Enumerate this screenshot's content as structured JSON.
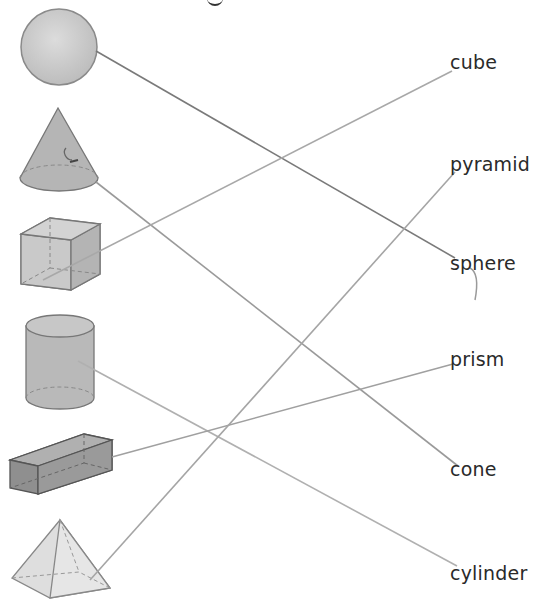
{
  "title_fragment": "g",
  "shapes": [
    {
      "id": "sphere",
      "name": "sphere"
    },
    {
      "id": "cone",
      "name": "cone"
    },
    {
      "id": "cube",
      "name": "cube"
    },
    {
      "id": "cylinder",
      "name": "cylinder"
    },
    {
      "id": "rect-prism",
      "name": "rectangular prism"
    },
    {
      "id": "pyramid",
      "name": "square pyramid"
    }
  ],
  "labels": [
    {
      "text": "cube",
      "x": 450,
      "y": 53
    },
    {
      "text": "pyramid",
      "x": 450,
      "y": 155
    },
    {
      "text": "sphere",
      "x": 450,
      "y": 254
    },
    {
      "text": "prism",
      "x": 450,
      "y": 350
    },
    {
      "text": "cone",
      "x": 450,
      "y": 460
    },
    {
      "text": "cylinder",
      "x": 450,
      "y": 564
    }
  ],
  "connections": [
    {
      "from": "sphere",
      "to": "sphere",
      "x1": 96,
      "y1": 51,
      "x2": 455,
      "y2": 258,
      "color": "#7a7a7a"
    },
    {
      "from": "cone",
      "to": "cone",
      "x1": 96,
      "y1": 182,
      "x2": 458,
      "y2": 466,
      "color": "#9a9a9a"
    },
    {
      "from": "cube",
      "to": "cube",
      "x1": 43,
      "y1": 280,
      "x2": 452,
      "y2": 71,
      "color": "#a8a8a8"
    },
    {
      "from": "cylinder",
      "to": "cylinder",
      "x1": 78,
      "y1": 361,
      "x2": 457,
      "y2": 566,
      "color": "#b0b0b0"
    },
    {
      "from": "rect-prism",
      "to": "prism",
      "x1": 112,
      "y1": 457,
      "x2": 453,
      "y2": 364,
      "color": "#a0a0a0"
    },
    {
      "from": "pyramid",
      "to": "pyramid",
      "x1": 90,
      "y1": 580,
      "x2": 455,
      "y2": 172,
      "color": "#a5a5a5"
    }
  ],
  "colors": {
    "shape_fill": "#c4c4c4",
    "shape_dark": "#8e8e8e",
    "outline": "#6e6e6e",
    "text": "#2a2a2a"
  }
}
